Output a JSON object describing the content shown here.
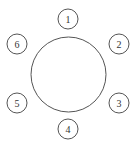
{
  "diagram": {
    "title": "",
    "table": {
      "shape": "circle",
      "cx": 68.5,
      "cy": 74.5,
      "r": 37.5,
      "stroke": "#555555"
    },
    "seats": [
      {
        "label": "1",
        "cx": 68,
        "cy": 19
      },
      {
        "label": "2",
        "cx": 119,
        "cy": 44
      },
      {
        "label": "3",
        "cx": 119,
        "cy": 103
      },
      {
        "label": "4",
        "cx": 68,
        "cy": 129
      },
      {
        "label": "5",
        "cx": 17,
        "cy": 103
      },
      {
        "label": "6",
        "cx": 17,
        "cy": 44
      }
    ],
    "seat_radius": 10,
    "stroke_color": "#555555",
    "text_color": "#333333"
  }
}
